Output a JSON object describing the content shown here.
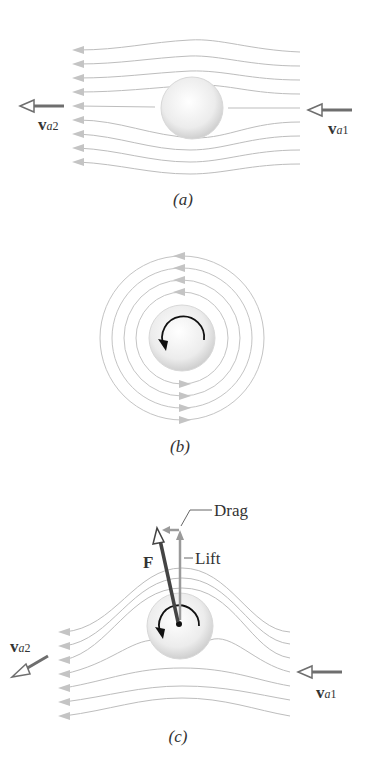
{
  "figure": {
    "panels": [
      {
        "id": "a",
        "caption": "(a)",
        "labels": {
          "v_in": {
            "main": "v",
            "sub": "a",
            "num": "1"
          },
          "v_out": {
            "main": "v",
            "sub": "a",
            "num": "2"
          }
        }
      },
      {
        "id": "b",
        "caption": "(b)"
      },
      {
        "id": "c",
        "caption": "(c)",
        "labels": {
          "force": "F",
          "drag": "Drag",
          "lift": "Lift",
          "v_in": {
            "main": "v",
            "sub": "a",
            "num": "1"
          },
          "v_out": {
            "main": "v",
            "sub": "a",
            "num": "2"
          }
        }
      }
    ],
    "colors": {
      "streamline": "#b8b8b8",
      "arrow_dark": "#6e6e6e",
      "force": "#444444",
      "ball": "#e6e6e6"
    }
  }
}
